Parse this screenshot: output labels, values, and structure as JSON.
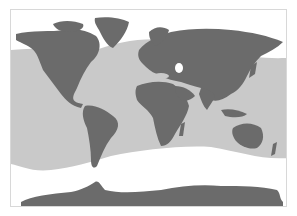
{
  "map": {
    "type": "world-distribution-map",
    "projection": "equirectangular-like",
    "colors": {
      "background": "#ffffff",
      "land": "#6b6b6b",
      "range_band": "#c9c9c9",
      "frame": "#d8d8d8"
    },
    "layers": [
      {
        "name": "land",
        "description": "Continents shown in dark gray"
      },
      {
        "name": "range_band",
        "description": "Light gray shaded ocean band spanning roughly from northern temperate latitudes to southern mid-latitudes across all oceans"
      },
      {
        "name": "unshaded_ocean",
        "description": "White polar/high-latitude ocean areas (Arctic and Southern Ocean)"
      }
    ]
  }
}
